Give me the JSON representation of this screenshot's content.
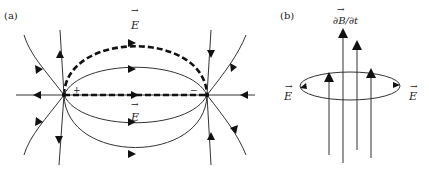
{
  "panel_a": {
    "label": "(a)",
    "positive_charge": "+",
    "negative_charge": "−",
    "field_label_top": "E",
    "field_label_axis": "E",
    "vector_arrow": "→"
  },
  "panel_b": {
    "label": "(b)",
    "flux_label": "∂B/∂t",
    "field_label_left": "E",
    "field_label_right": "E",
    "vector_arrow": "→"
  },
  "colors": {
    "line": "#333333",
    "dashed": "#111111",
    "background": "#ffffff"
  }
}
